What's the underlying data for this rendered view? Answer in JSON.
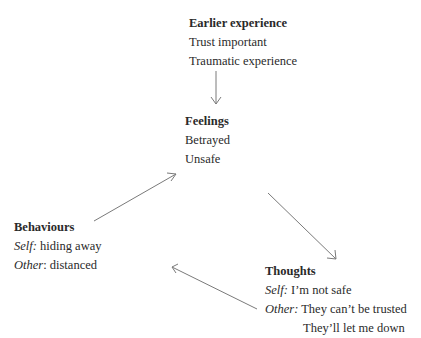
{
  "nodes": {
    "earlier": {
      "title": "Earlier experience",
      "lines": [
        "Trust important",
        "Traumatic experience"
      ]
    },
    "feelings": {
      "title": "Feelings",
      "lines": [
        "Betrayed",
        "Unsafe"
      ]
    },
    "behaviours": {
      "title": "Behaviours",
      "self_label": "Self:",
      "self_text": " hiding away",
      "other_label": "Other",
      "other_text": ": distanced"
    },
    "thoughts": {
      "title": "Thoughts",
      "self_label": "Self:",
      "self_text": " I’m not safe",
      "other_label": "Other:",
      "other_text": " They can’t be trusted",
      "extra": "They’ll let me down"
    }
  },
  "edges": [
    {
      "from": "earlier",
      "to": "feelings"
    },
    {
      "from": "feelings",
      "to": "thoughts"
    },
    {
      "from": "thoughts",
      "to": "behaviours"
    },
    {
      "from": "behaviours",
      "to": "feelings"
    }
  ],
  "colors": {
    "arrow": "#7a7a7a",
    "text": "#2a2a2a"
  }
}
